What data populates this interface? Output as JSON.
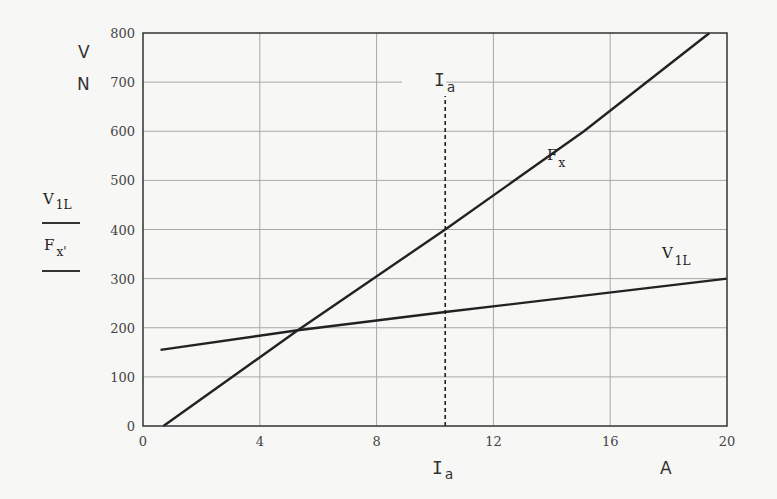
{
  "chart_data": {
    "type": "line",
    "title": "",
    "xlabel": "I_a",
    "xunit": "A",
    "ylabel": "V_1L / F_x",
    "yunits": [
      "V",
      "N"
    ],
    "xlim": [
      0,
      20
    ],
    "ylim": [
      0,
      800
    ],
    "xticks": [
      0,
      4,
      8,
      12,
      16,
      20
    ],
    "yticks": [
      0,
      100,
      200,
      300,
      400,
      500,
      600,
      700,
      800
    ],
    "grid": true,
    "series": [
      {
        "name": "F_x",
        "x": [
          0.7,
          5.3,
          10.35,
          15.1,
          19.4
        ],
        "values": [
          0,
          195,
          400,
          600,
          800
        ]
      },
      {
        "name": "V_1L",
        "x": [
          0.6,
          5.3,
          10.35,
          20
        ],
        "values": [
          155,
          195,
          232,
          300
        ]
      }
    ],
    "annotations": [
      {
        "type": "vline",
        "x": 10.35,
        "style": "dashed",
        "label": "I_a"
      }
    ]
  },
  "labels": {
    "y_unit_top": "V",
    "y_unit_bottom": "N",
    "legend_v_main": "V",
    "legend_v_sub": "1L",
    "legend_f_main": "F",
    "legend_f_sub": "x'",
    "x_axis_main": "I",
    "x_axis_sub": "a",
    "x_unit": "A",
    "vline_main": "I",
    "vline_sub": "a",
    "curve_f_main": "F",
    "curve_f_sub": "x",
    "curve_v_main": "V",
    "curve_v_sub": "1L"
  }
}
